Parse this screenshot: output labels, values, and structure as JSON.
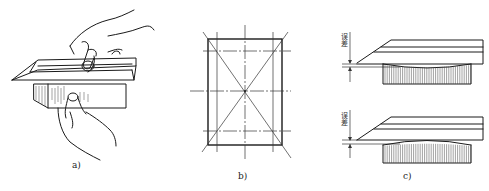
{
  "figure": {
    "panels": [
      {
        "id": "a",
        "label": "a)",
        "description": "hands holding knife-edge straightedge against workpiece"
      },
      {
        "id": "b",
        "label": "b)",
        "description": "rectangle with inspection lines: diagonals, center lines and offset lines"
      },
      {
        "id": "c",
        "label": "c)",
        "description": "straightedge on concave and convex surfaces showing error gap"
      }
    ],
    "error_label_top": "误差",
    "error_label_bottom": "误差"
  }
}
